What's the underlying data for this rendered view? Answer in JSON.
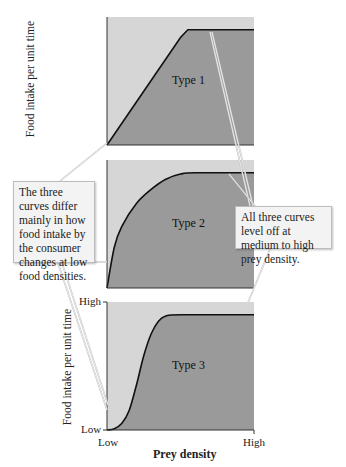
{
  "chart_data": {
    "type": "line",
    "title": "",
    "xlabel": "Prey density",
    "ylabel": "Food intake per unit time",
    "x_ticks": [
      "Low",
      "High"
    ],
    "y_ticks": [
      "Low",
      "High"
    ],
    "xlim": [
      0,
      1
    ],
    "ylim": [
      0,
      1
    ],
    "panels": [
      {
        "name": "Type 1",
        "x": [
          0,
          0.5,
          0.55,
          1
        ],
        "y": [
          0,
          0.84,
          0.9,
          0.9
        ]
      },
      {
        "name": "Type 2",
        "x": [
          0,
          0.05,
          0.1,
          0.2,
          0.3,
          0.4,
          0.5,
          0.6,
          1
        ],
        "y": [
          0,
          0.32,
          0.48,
          0.66,
          0.77,
          0.85,
          0.89,
          0.9,
          0.9
        ]
      },
      {
        "name": "Type 3",
        "x": [
          0,
          0.05,
          0.1,
          0.15,
          0.2,
          0.25,
          0.3,
          0.35,
          0.4,
          0.5,
          1
        ],
        "y": [
          0,
          0.01,
          0.05,
          0.15,
          0.35,
          0.58,
          0.75,
          0.85,
          0.89,
          0.9,
          0.9
        ]
      }
    ],
    "annotations": [
      "The three curves differ mainly in how food intake by the consumer changes at low food densities.",
      "All three curves level off at medium to high prey density."
    ]
  },
  "colors": {
    "above": "#d6d6d6",
    "below": "#9a9a9a",
    "curve": "#111111"
  },
  "labels": {
    "ylabel": "Food intake per unit time",
    "ylabel_bottom": "Food intake per unit time",
    "y_high": "High",
    "y_low": "Low",
    "x_low": "Low",
    "x_high": "High",
    "xtitle": "Prey density",
    "type1": "Type 1",
    "type2": "Type 2",
    "type3": "Type 3",
    "left_callout": "The three curves differ mainly in how food intake by the consumer changes at low food densities.",
    "right_callout": "All three curves level off at medium to high prey density."
  }
}
